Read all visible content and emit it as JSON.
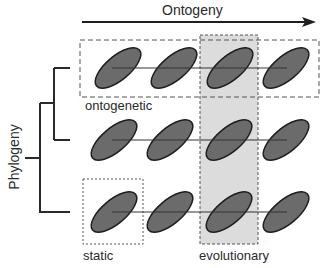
{
  "axes": {
    "x_title": "Ontogeny",
    "y_title": "Phylogeny"
  },
  "labels": {
    "ontogenetic": "ontogenetic",
    "static": "static",
    "evolutionary": "evolutionary"
  },
  "grid": {
    "rows": 3,
    "columns": 4,
    "row_centers_y": [
      68,
      140,
      212
    ],
    "column_centers_x": [
      118,
      170,
      229,
      286
    ],
    "ellipse_fill": "#6b6b6b",
    "ellipse_stroke": "#1e1e1e"
  },
  "highlights": {
    "ontogenetic_box": "row 1, all columns (dashed)",
    "static_box": "row 3, column 1 (dotted)",
    "evolutionary_box": "column 3, all rows (grey shaded, dashed)",
    "evolutionary_fill": "#dcdcdc"
  }
}
